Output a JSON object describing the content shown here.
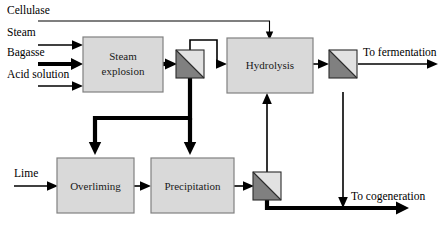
{
  "diagram": {
    "colors": {
      "box_fill": "#d9d9d9",
      "box_stroke": "#808080",
      "separator_light": "#e2e2e2",
      "separator_dark": "#808080",
      "line": "#000000",
      "background": "#ffffff"
    },
    "process_boxes": [
      {
        "id": "steam-explosion",
        "label_line1": "Steam",
        "label_line2": "explosion"
      },
      {
        "id": "hydrolysis",
        "label_line1": "Hydrolysis",
        "label_line2": ""
      },
      {
        "id": "overliming",
        "label_line1": "Overliming",
        "label_line2": ""
      },
      {
        "id": "precipitation",
        "label_line1": "Precipitation",
        "label_line2": ""
      }
    ],
    "input_labels": [
      {
        "id": "cellulase",
        "text": "Cellulase"
      },
      {
        "id": "steam",
        "text": "Steam"
      },
      {
        "id": "bagasse",
        "text": "Bagasse"
      },
      {
        "id": "acid-solution",
        "text": "Acid solution"
      },
      {
        "id": "lime",
        "text": "Lime"
      }
    ],
    "output_labels": [
      {
        "id": "to-fermentation",
        "text": "To fermentation"
      },
      {
        "id": "to-cogeneration",
        "text": "To cogeneration"
      }
    ],
    "separators": [
      {
        "id": "separator-steam-explosion"
      },
      {
        "id": "separator-hydrolysis"
      },
      {
        "id": "separator-precipitation"
      }
    ]
  }
}
